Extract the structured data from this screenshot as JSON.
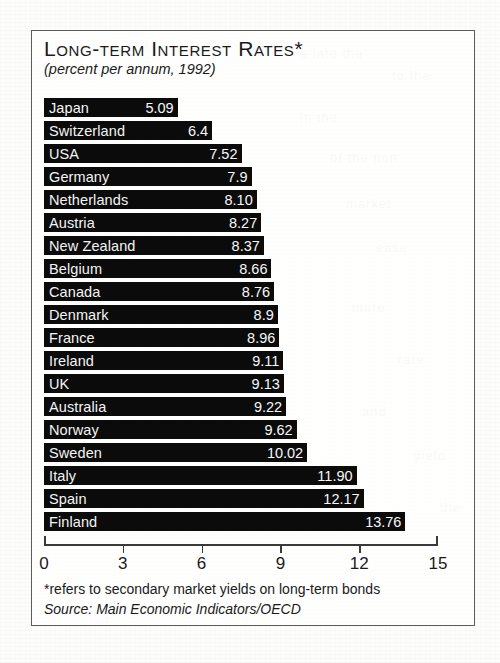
{
  "figure": {
    "title": "Long-term Interest Rates*",
    "subtitle": "(percent per annum, 1992)",
    "footnote": "*refers to secondary market yields on long-term bonds",
    "source": "Source: Main Economic Indicators/OECD",
    "frame_color": "#5d5d5d",
    "bar_color": "#0b0b0b",
    "bar_text_color": "#f4f4f4",
    "background_color": "#ffffff"
  },
  "chart_data": {
    "type": "bar",
    "orientation": "horizontal",
    "title": "Long-term Interest Rates*",
    "subtitle": "(percent per annum, 1992)",
    "xlabel": "",
    "ylabel": "",
    "xlim": [
      0,
      15
    ],
    "grid": false,
    "legend": "none",
    "xticks": [
      0,
      3,
      6,
      9,
      12,
      15
    ],
    "xtick_labels": [
      "0",
      "3",
      "6",
      "9",
      "12",
      "15"
    ],
    "categories": [
      "Japan",
      "Switzerland",
      "USA",
      "Germany",
      "Netherlands",
      "Austria",
      "New Zealand",
      "Belgium",
      "Canada",
      "Denmark",
      "France",
      "Ireland",
      "UK",
      "Australia",
      "Norway",
      "Sweden",
      "Italy",
      "Spain",
      "Finland"
    ],
    "values": [
      5.09,
      6.4,
      7.52,
      7.9,
      8.1,
      8.27,
      8.37,
      8.66,
      8.76,
      8.9,
      8.96,
      9.11,
      9.13,
      9.22,
      9.62,
      10.02,
      11.9,
      12.17,
      13.76
    ],
    "value_labels": [
      "5.09",
      "6.4",
      "7.52",
      "7.9",
      "8.10",
      "8.27",
      "8.37",
      "8.66",
      "8.76",
      "8.9",
      "8.96",
      "9.11",
      "9.13",
      "9.22",
      "9.62",
      "10.02",
      "11.90",
      "12.17",
      "13.76"
    ],
    "annotations": [
      "*refers to secondary market yields on long-term bonds",
      "Source: Main Economic Indicators/OECD"
    ]
  },
  "bleed_text": [
    {
      "text": "a late the",
      "left": 300,
      "top": 46
    },
    {
      "text": "to the",
      "left": 392,
      "top": 68
    },
    {
      "text": "in the",
      "left": 300,
      "top": 110
    },
    {
      "text": "of the non",
      "left": 330,
      "top": 150
    },
    {
      "text": "market",
      "left": 346,
      "top": 196
    },
    {
      "text": "ease",
      "left": 376,
      "top": 240
    },
    {
      "text": "more",
      "left": 352,
      "top": 300
    },
    {
      "text": "rate",
      "left": 398,
      "top": 352
    },
    {
      "text": "and",
      "left": 362,
      "top": 404
    },
    {
      "text": "yield",
      "left": 414,
      "top": 448
    },
    {
      "text": "the",
      "left": 440,
      "top": 500
    }
  ]
}
